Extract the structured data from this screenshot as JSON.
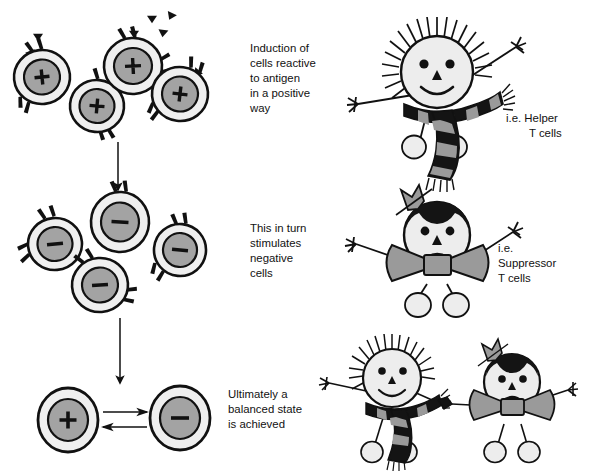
{
  "figure": {
    "width": 589,
    "height": 473,
    "background": "#ffffff"
  },
  "palette": {
    "ink": "#111111",
    "cell_outer": "#efefef",
    "cell_nucleus": "#a3a3a3",
    "figure_skin": "#ededed",
    "accessory_gray": "#9a9a9a",
    "hair_dark": "#141414",
    "stripe_dark": "#141414",
    "stripe_light": "#9a9a9a",
    "foot_fill": "#ededed"
  },
  "stages": [
    {
      "id": "stage-positive",
      "caption": [
        "Induction of",
        "cells reactive",
        "to antigen",
        "in a positive",
        "way"
      ],
      "cell_sign": "+",
      "cell_count": 4,
      "antigen_count": 7
    },
    {
      "id": "stage-negative",
      "caption": [
        "This in turn",
        "stimulates",
        "negative",
        "cells"
      ],
      "cell_sign": "−",
      "cell_count": 4,
      "antigen_count": 0
    },
    {
      "id": "stage-balanced",
      "caption": [
        "Ultimately a",
        "balanced state",
        "is achieved"
      ],
      "cell_sign_left": "+",
      "cell_sign_right": "−",
      "cell_count": 2,
      "antigen_count": 0
    }
  ],
  "cells": {
    "positive": [
      {
        "cx": 42,
        "cy": 77,
        "rx": 28,
        "ry": 27,
        "sign": "+",
        "rot": -6
      },
      {
        "cx": 97,
        "cy": 106,
        "rx": 27,
        "ry": 26,
        "sign": "+",
        "rot": 4
      },
      {
        "cx": 133,
        "cy": 66,
        "rx": 29,
        "ry": 28,
        "sign": "+",
        "rot": -3
      },
      {
        "cx": 180,
        "cy": 94,
        "rx": 28,
        "ry": 27,
        "sign": "+",
        "rot": 7
      }
    ],
    "negative": [
      {
        "cx": 55,
        "cy": 244,
        "rx": 27,
        "ry": 26,
        "sign": "−",
        "rot": -5
      },
      {
        "cx": 120,
        "cy": 222,
        "rx": 29,
        "ry": 30,
        "sign": "−",
        "rot": 3
      },
      {
        "cx": 100,
        "cy": 285,
        "rx": 28,
        "ry": 27,
        "sign": "−",
        "rot": -4
      },
      {
        "cx": 180,
        "cy": 250,
        "rx": 26,
        "ry": 26,
        "sign": "−",
        "rot": 5
      }
    ],
    "balanced": [
      {
        "cx": 68,
        "cy": 420,
        "rx": 30,
        "ry": 32,
        "sign": "+",
        "rot": 0
      },
      {
        "cx": 180,
        "cy": 418,
        "rx": 30,
        "ry": 32,
        "sign": "−",
        "rot": 0
      }
    ]
  },
  "antigens": [
    {
      "x": 38,
      "y": 37,
      "rot": 0
    },
    {
      "x": 30,
      "y": 53,
      "rot": -25
    },
    {
      "x": 134,
      "y": 34,
      "rot": 0
    },
    {
      "x": 152,
      "y": 19,
      "rot": 0
    },
    {
      "x": 170,
      "y": 16,
      "rot": 20
    },
    {
      "x": 163,
      "y": 33,
      "rot": 10
    },
    {
      "x": 196,
      "y": 73,
      "rot": 35
    },
    {
      "x": 94,
      "y": 89,
      "rot": 0
    }
  ],
  "arrows": {
    "stage1_to_stage2": {
      "x1": 118,
      "y1": 140,
      "x2": 118,
      "y2": 192,
      "label": "downward-arrow"
    },
    "stage2_to_stage3": {
      "x1": 120,
      "y1": 318,
      "x2": 120,
      "y2": 385,
      "label": "downward-arrow"
    },
    "equilibrium": {
      "label": "equilibrium-double-arrow",
      "x_left": 104,
      "x_right": 148,
      "y_top": 412,
      "y_bottom": 427
    }
  },
  "captions": [
    {
      "id": "caption-positive",
      "x": 250,
      "y": 52,
      "lines": [
        "Induction of",
        "cells reactive",
        "to antigen",
        "in a positive",
        "way"
      ]
    },
    {
      "id": "caption-negative",
      "x": 250,
      "y": 232,
      "lines": [
        "This in turn",
        "stimulates",
        "negative",
        "cells"
      ]
    },
    {
      "id": "caption-balanced",
      "x": 228,
      "y": 398,
      "lines": [
        "Ultimately a",
        "balanced state",
        "is achieved"
      ]
    }
  ],
  "figure_labels": [
    {
      "id": "label-helper",
      "x": 506,
      "y": 122,
      "lines": [
        {
          "text": "i.e.  Helper",
          "indent": 0
        },
        {
          "text": "T cells",
          "indent": 23
        }
      ]
    },
    {
      "id": "label-suppressor",
      "x": 498,
      "y": 252,
      "lines": [
        {
          "text": "i.e.",
          "indent": 0
        },
        {
          "text": "Suppressor",
          "indent": 0
        },
        {
          "text": "T cells",
          "indent": 0
        }
      ]
    }
  ],
  "characters": [
    {
      "id": "helper-t-cell-figure",
      "type": "helper",
      "mood": "happy",
      "accessory": "striped-scarf",
      "hair": "spiky-light",
      "cx": 437,
      "cy": 72,
      "scale": 1.0
    },
    {
      "id": "suppressor-t-cell-figure",
      "type": "suppressor",
      "mood": "sad",
      "accessory": "bow-tie",
      "hair": "dark-cap-with-bow",
      "cx": 437,
      "cy": 235,
      "scale": 0.95
    },
    {
      "id": "helper-t-cell-figure-paired",
      "type": "helper",
      "mood": "happy",
      "accessory": "striped-scarf",
      "hair": "spiky-light",
      "cx": 392,
      "cy": 378,
      "scale": 0.78
    },
    {
      "id": "suppressor-t-cell-figure-paired",
      "type": "suppressor",
      "mood": "sad",
      "accessory": "bow-tie",
      "hair": "dark-cap-with-bow",
      "cx": 512,
      "cy": 382,
      "scale": 0.78
    }
  ]
}
